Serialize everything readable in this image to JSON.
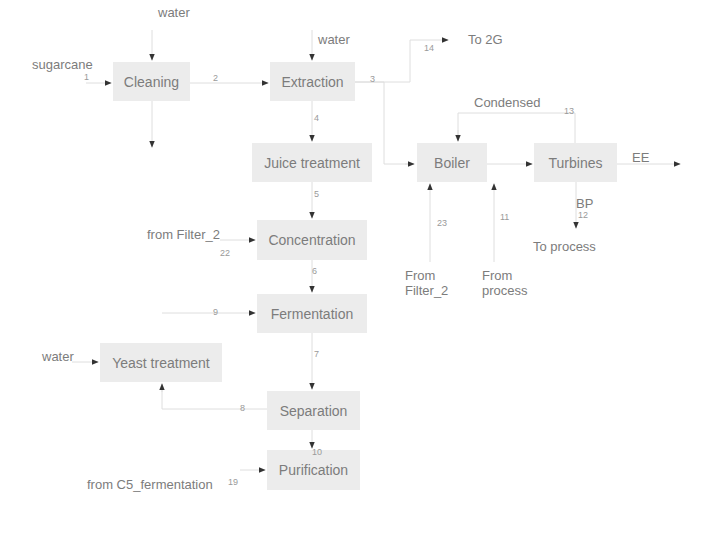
{
  "diagram": {
    "type": "process-flow",
    "units": {
      "cleaning": "Cleaning",
      "extraction": "Extraction",
      "juice_treatment": "Juice treatment",
      "boiler": "Boiler",
      "turbines": "Turbines",
      "concentration": "Concentration",
      "fermentation": "Fermentation",
      "yeast_treatment": "Yeast treatment",
      "separation": "Separation",
      "purification": "Purification"
    },
    "labels": {
      "water_cleaning": "water",
      "sugarcane": "sugarcane",
      "water_extraction": "water",
      "to_2g": "To 2G",
      "condensed": "Condensed",
      "ee": "EE",
      "bp": "BP",
      "to_process": "To process",
      "from_filter2_boiler": "From\nFilter_2",
      "from_process": "From\nprocess",
      "from_filter2_conc": "from Filter_2",
      "water_yeast": "water",
      "from_c5": "from C5_fermentation"
    },
    "streams": {
      "s1": "1",
      "s2": "2",
      "s3": "3",
      "s4": "4",
      "s5": "5",
      "s6": "6",
      "s7": "7",
      "s8": "8",
      "s9": "9",
      "s10": "10",
      "s11": "11",
      "s12": "12",
      "s13": "13",
      "s14": "14",
      "s19": "19",
      "s22": "22",
      "s23": "23"
    },
    "edges": [
      {
        "from": "sugarcane",
        "to": "Cleaning",
        "stream": "1"
      },
      {
        "from": "water",
        "to": "Cleaning"
      },
      {
        "from": "Cleaning",
        "to": "Extraction",
        "stream": "2"
      },
      {
        "from": "Cleaning",
        "to": "waste (down)"
      },
      {
        "from": "water",
        "to": "Extraction"
      },
      {
        "from": "Extraction",
        "to": "To 2G",
        "stream": "14"
      },
      {
        "from": "Extraction",
        "to": "Boiler",
        "stream": "3"
      },
      {
        "from": "Extraction",
        "to": "Juice treatment",
        "stream": "4"
      },
      {
        "from": "Juice treatment",
        "to": "Concentration",
        "stream": "5"
      },
      {
        "from": "From Filter_2",
        "to": "Boiler",
        "stream": "23"
      },
      {
        "from": "From process",
        "to": "Boiler",
        "stream": "11"
      },
      {
        "from": "Boiler",
        "to": "Turbines"
      },
      {
        "from": "Turbines",
        "to": "Boiler",
        "label": "Condensed",
        "stream": "13"
      },
      {
        "from": "Turbines",
        "to": "EE"
      },
      {
        "from": "Turbines",
        "to": "To process",
        "label": "BP",
        "stream": "12"
      },
      {
        "from": "from Filter_2",
        "to": "Concentration",
        "stream": "22"
      },
      {
        "from": "Concentration",
        "to": "Fermentation",
        "stream": "6"
      },
      {
        "from": "Yeast treatment",
        "to": "Fermentation",
        "stream": "9"
      },
      {
        "from": "Fermentation",
        "to": "Separation",
        "stream": "7"
      },
      {
        "from": "Separation",
        "to": "Yeast treatment",
        "stream": "8"
      },
      {
        "from": "water",
        "to": "Yeast treatment"
      },
      {
        "from": "Separation",
        "to": "Purification",
        "stream": "10"
      },
      {
        "from": "from C5_fermentation",
        "to": "Purification",
        "stream": "19"
      }
    ]
  }
}
